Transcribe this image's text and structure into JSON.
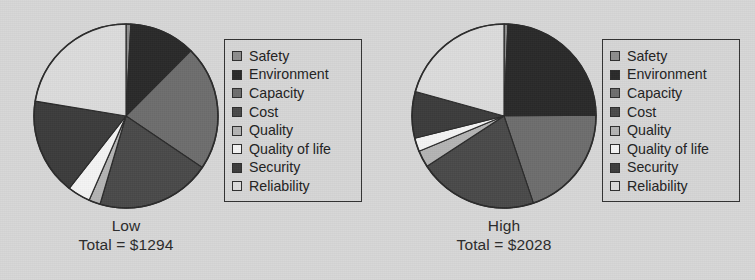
{
  "figure": {
    "background_color": "#d7d7d7",
    "text_color": "#2b2b2b",
    "border_color": "#333333"
  },
  "legend": {
    "items": [
      {
        "label": "Safety",
        "color": "#8d8d8d"
      },
      {
        "label": "Environment",
        "color": "#2a2a2a"
      },
      {
        "label": "Capacity",
        "color": "#6e6e6e"
      },
      {
        "label": "Cost",
        "color": "#4a4a4a"
      },
      {
        "label": "Quality",
        "color": "#b4b4b4"
      },
      {
        "label": "Quality of life",
        "color": "#f4f4f4"
      },
      {
        "label": "Security",
        "color": "#3c3c3c"
      },
      {
        "label": "Reliability",
        "color": "#dcdcdc"
      }
    ]
  },
  "panels": [
    {
      "id": "low",
      "title": "Low",
      "total_label": "Total = $1294"
    },
    {
      "id": "high",
      "title": "High",
      "total_label": "Total = $2028"
    }
  ],
  "chart_data": [
    {
      "type": "pie",
      "title": "Low",
      "subtitle": "Total = $1294",
      "total": 1294,
      "currency": "$",
      "start_angle_deg": 90,
      "direction": "clockwise",
      "legend_position": "right",
      "categories": [
        "Safety",
        "Environment",
        "Capacity",
        "Cost",
        "Quality",
        "Quality of life",
        "Security",
        "Reliability"
      ],
      "values": [
        11,
        150,
        285,
        260,
        26,
        52,
        220,
        290
      ],
      "percentages": [
        0.9,
        11.6,
        22.0,
        20.1,
        2.0,
        4.0,
        17.0,
        22.4
      ],
      "colors": [
        "#8d8d8d",
        "#2a2a2a",
        "#6e6e6e",
        "#4a4a4a",
        "#b4b4b4",
        "#f4f4f4",
        "#3c3c3c",
        "#dcdcdc"
      ]
    },
    {
      "type": "pie",
      "title": "High",
      "subtitle": "Total = $2028",
      "total": 2028,
      "currency": "$",
      "start_angle_deg": 90,
      "direction": "clockwise",
      "legend_position": "right",
      "categories": [
        "Safety",
        "Environment",
        "Capacity",
        "Cost",
        "Quality",
        "Quality of life",
        "Security",
        "Reliability"
      ],
      "values": [
        14,
        490,
        405,
        425,
        60,
        48,
        166,
        420
      ],
      "percentages": [
        0.7,
        24.2,
        20.0,
        21.0,
        3.0,
        2.4,
        8.2,
        20.7
      ],
      "colors": [
        "#8d8d8d",
        "#2a2a2a",
        "#6e6e6e",
        "#4a4a4a",
        "#b4b4b4",
        "#f4f4f4",
        "#3c3c3c",
        "#dcdcdc"
      ]
    }
  ]
}
